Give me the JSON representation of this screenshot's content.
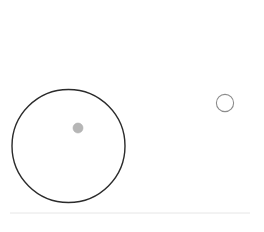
{
  "canvas": {
    "width": 264,
    "height": 232,
    "background_color": "#ffffff",
    "title": "Circle Diagram"
  },
  "shapes": {
    "large_circle": {
      "name": "large-outline-circle",
      "role": "large unfilled circle outline",
      "cx": 68.5,
      "cy": 146,
      "r": 56.5,
      "stroke_color": "#2b2b2b",
      "stroke_width": 1.4,
      "fill": "none"
    },
    "inner_dot": {
      "name": "gray-dot",
      "role": "small filled gray dot inside large circle",
      "cx": 78,
      "cy": 128,
      "r": 5,
      "fill_color": "#b6b6b6",
      "stroke_color": "#aeaeae",
      "stroke_width": 0.6
    },
    "small_circle": {
      "name": "small-outline-circle",
      "role": "small unfilled circle outline at right",
      "cx": 225,
      "cy": 103,
      "r": 8.6,
      "stroke_color": "#8c8c8c",
      "stroke_width": 1.1,
      "fill": "none"
    },
    "divider_line": {
      "name": "bottom-divider-line",
      "role": "faint horizontal rule near bottom",
      "x1": 10,
      "x2": 250,
      "y": 213,
      "stroke_color": "#e6e6e6",
      "stroke_width": 1
    }
  }
}
